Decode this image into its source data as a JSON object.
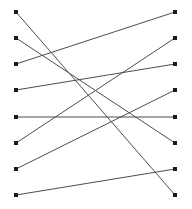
{
  "figure": {
    "type": "bipartite-graph",
    "width": 192,
    "height": 209,
    "background_color": "#ffffff"
  },
  "style": {
    "edge_color": "#4d4d4d",
    "edge_width": 1,
    "node_color": "#1a1a1a",
    "node_size": 4,
    "node_shape": "square"
  },
  "chart_data": {
    "type": "diagram",
    "title": "",
    "xlabel": "",
    "ylabel": "",
    "left_nodes": [
      {
        "id": "L1",
        "label": "",
        "x": 16,
        "y": 12
      },
      {
        "id": "L2",
        "label": "",
        "x": 16,
        "y": 38
      },
      {
        "id": "L3",
        "label": "",
        "x": 16,
        "y": 64
      },
      {
        "id": "L4",
        "label": "",
        "x": 16,
        "y": 90
      },
      {
        "id": "L5",
        "label": "",
        "x": 16,
        "y": 117
      },
      {
        "id": "L6",
        "label": "",
        "x": 16,
        "y": 143
      },
      {
        "id": "L7",
        "label": "",
        "x": 16,
        "y": 169
      },
      {
        "id": "L8",
        "label": "",
        "x": 16,
        "y": 195
      }
    ],
    "right_nodes": [
      {
        "id": "R1",
        "label": "",
        "x": 175,
        "y": 12
      },
      {
        "id": "R2",
        "label": "",
        "x": 175,
        "y": 38
      },
      {
        "id": "R3",
        "label": "",
        "x": 175,
        "y": 64
      },
      {
        "id": "R4",
        "label": "",
        "x": 175,
        "y": 90
      },
      {
        "id": "R5",
        "label": "",
        "x": 175,
        "y": 117
      },
      {
        "id": "R6",
        "label": "",
        "x": 175,
        "y": 143
      },
      {
        "id": "R7",
        "label": "",
        "x": 175,
        "y": 169
      },
      {
        "id": "R8",
        "label": "",
        "x": 175,
        "y": 195
      }
    ],
    "edges": [
      {
        "from": "L1",
        "to": "R8",
        "x1": 16,
        "y1": 12,
        "x2": 175,
        "y2": 195
      },
      {
        "from": "L2",
        "to": "R6",
        "x1": 16,
        "y1": 38,
        "x2": 175,
        "y2": 143
      },
      {
        "from": "L3",
        "to": "R1",
        "x1": 16,
        "y1": 64,
        "x2": 175,
        "y2": 12
      },
      {
        "from": "L4",
        "to": "R3",
        "x1": 16,
        "y1": 90,
        "x2": 175,
        "y2": 64
      },
      {
        "from": "L5",
        "to": "R5",
        "x1": 16,
        "y1": 117,
        "x2": 175,
        "y2": 117
      },
      {
        "from": "L6",
        "to": "R2",
        "x1": 16,
        "y1": 143,
        "x2": 175,
        "y2": 38
      },
      {
        "from": "L7",
        "to": "R4",
        "x1": 16,
        "y1": 169,
        "x2": 175,
        "y2": 90
      },
      {
        "from": "L8",
        "to": "R7",
        "x1": 16,
        "y1": 195,
        "x2": 175,
        "y2": 169
      }
    ],
    "node_count": 16,
    "edge_count": 8
  }
}
